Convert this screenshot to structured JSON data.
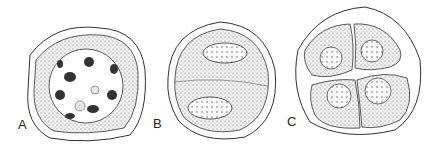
{
  "figure": {
    "panels": [
      {
        "label": "A",
        "description": "cell with nucleus containing condensed chromosomes and nucleoli"
      },
      {
        "label": "B",
        "description": "cell divided into two with two nuclei"
      },
      {
        "label": "C",
        "description": "tetrad of four cells each with nucleus"
      }
    ],
    "colors": {
      "stroke": "#333333",
      "stipple": "#c8c8c8",
      "background": "#ffffff"
    }
  }
}
